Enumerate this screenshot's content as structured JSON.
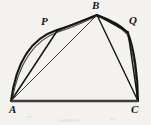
{
  "figure": {
    "background_color": "#f4f2ef",
    "ink_color": "#141414",
    "width": 151,
    "height": 125,
    "caption": ""
  },
  "points": {
    "A": {
      "label": "A",
      "x": 11,
      "y": 101,
      "label_x": 9,
      "label_y": 104
    },
    "P": {
      "label": "P",
      "x": 57,
      "y": 31,
      "label_x": 41,
      "label_y": 17
    },
    "B": {
      "label": "B",
      "x": 97,
      "y": 15,
      "label_x": 92,
      "label_y": 1
    },
    "Q": {
      "label": "Q",
      "x": 128,
      "y": 31,
      "label_x": 129,
      "label_y": 16
    },
    "C": {
      "label": "C",
      "x": 138,
      "y": 101,
      "label_x": 131,
      "label_y": 104
    }
  },
  "segments": [
    {
      "name": "base-AC",
      "from": "A",
      "to": "C",
      "stroke_width": 2.6,
      "color": "#3d3a37"
    },
    {
      "name": "chord-AP",
      "from": "A",
      "to": "P",
      "stroke_width": 1.5,
      "color": "#141414"
    },
    {
      "name": "chord-PB",
      "from": "P",
      "to": "B",
      "stroke_width": 1.5,
      "color": "#141414"
    },
    {
      "name": "chord-AB",
      "from": "A",
      "to": "B",
      "stroke_width": 0.9,
      "color": "#2a2724"
    },
    {
      "name": "chord-BQ",
      "from": "B",
      "to": "Q",
      "stroke_width": 1.5,
      "color": "#141414"
    },
    {
      "name": "chord-QC",
      "from": "Q",
      "to": "C",
      "stroke_width": 1.5,
      "color": "#141414"
    },
    {
      "name": "chord-BC",
      "from": "B",
      "to": "C",
      "stroke_width": 1.4,
      "color": "#141414"
    }
  ],
  "arc": {
    "name": "arc-A-P-B-Q-C",
    "through": [
      "A",
      "P",
      "B",
      "Q",
      "C"
    ],
    "stroke_width": 2.0,
    "color": "#141414"
  },
  "labels_order": [
    "A",
    "P",
    "B",
    "Q",
    "C"
  ]
}
